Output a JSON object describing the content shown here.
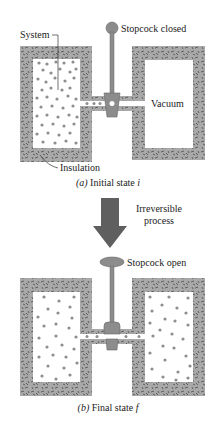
{
  "figure": {
    "panel_a": {
      "caption_prefix": "(a)",
      "caption_text": "Initial state",
      "caption_var": "i",
      "labels": {
        "system": "System",
        "stopcock": "Stopcock closed",
        "vacuum": "Vacuum",
        "insulation": "Insulation"
      },
      "stopcock_state": "closed"
    },
    "process": {
      "line1": "Irreversible",
      "line2": "process"
    },
    "panel_b": {
      "caption_prefix": "(b)",
      "caption_text": "Final state",
      "caption_var": "f",
      "labels": {
        "stopcock": "Stopcock open"
      },
      "stopcock_state": "open"
    },
    "colors": {
      "insulation": "#a9a9a9",
      "insulation_fleck": "#4a4a4a",
      "gas_dot": "#8e8e8e",
      "stopcock": "#8c8c8c",
      "arrow": "#5f5f5f",
      "chamber": "#ffffff"
    }
  }
}
